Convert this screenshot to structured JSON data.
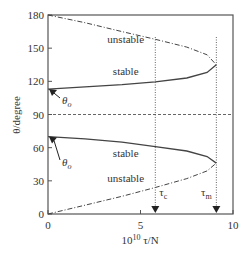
{
  "chart_data": {
    "type": "line",
    "title": "",
    "xlabel": "10^10 τ/N",
    "xlabel_parts": {
      "base": "10",
      "exp": "10",
      "rest": " τ/N"
    },
    "ylabel": "θ/degree",
    "xlim": [
      0,
      10
    ],
    "ylim": [
      0,
      180
    ],
    "x_ticks": [
      0,
      5,
      10
    ],
    "y_ticks": [
      0,
      30,
      60,
      90,
      120,
      150,
      180
    ],
    "x_tick_labels": [
      "0",
      "5",
      "10"
    ],
    "y_tick_labels": [
      "0",
      "30",
      "60",
      "90",
      "120",
      "150",
      "180"
    ],
    "grid": false,
    "legend": null,
    "series": [
      {
        "name": "upper stable",
        "style": "solid",
        "x": [
          0,
          2,
          4,
          5.8,
          7.5,
          8.6,
          9.1
        ],
        "y": [
          113,
          115,
          117,
          119.5,
          123,
          128,
          135
        ]
      },
      {
        "name": "upper unstable",
        "style": "dash-dot",
        "x": [
          0,
          2,
          4,
          5.8,
          7.5,
          8.6,
          9.1
        ],
        "y": [
          180,
          173,
          165,
          158,
          151,
          144,
          135
        ]
      },
      {
        "name": "lower stable",
        "style": "solid",
        "x": [
          0,
          2,
          4,
          5.8,
          7.5,
          8.6,
          9.1
        ],
        "y": [
          70,
          68,
          65,
          61,
          57,
          52,
          46
        ]
      },
      {
        "name": "lower unstable",
        "style": "dash-dot",
        "x": [
          0,
          2,
          4,
          5.8,
          7.5,
          8.6,
          9.1
        ],
        "y": [
          0,
          8,
          16,
          24,
          32,
          39,
          46
        ]
      }
    ],
    "reference_lines": [
      {
        "orientation": "horizontal",
        "value": 90,
        "style": "dashed"
      },
      {
        "orientation": "vertical",
        "value": 5.8,
        "style": "dotted",
        "label": "τc"
      },
      {
        "orientation": "vertical",
        "value": 9.1,
        "style": "dotted",
        "label": "τm"
      }
    ],
    "annotations": [
      {
        "text": "unstable",
        "x": 4.2,
        "y": 155
      },
      {
        "text": "stable",
        "x": 4.2,
        "y": 126
      },
      {
        "text": "stable",
        "x": 4.2,
        "y": 52
      },
      {
        "text": "unstable",
        "x": 4.2,
        "y": 29
      },
      {
        "text": "θo",
        "x": 0.5,
        "y": 122,
        "arrow_to": [
          0,
          113
        ]
      },
      {
        "text": "θo",
        "x": 0.5,
        "y": 58,
        "arrow_to": [
          0,
          70
        ]
      },
      {
        "text": "τc",
        "x": 5.8,
        "y": 10,
        "marker": "down-triangle"
      },
      {
        "text": "τm",
        "x": 9.1,
        "y": 10,
        "marker": "down-triangle"
      }
    ]
  },
  "labels": {
    "theta0": "θ",
    "theta0_sub": "o",
    "tau": "τ",
    "tau_c_sub": "c",
    "tau_m_sub": "m",
    "stable": "stable",
    "unstable": "unstable",
    "ylabel": "θ/degree",
    "xlabel_base": "10",
    "xlabel_exp": "10",
    "xlabel_rest": " τ/N"
  }
}
